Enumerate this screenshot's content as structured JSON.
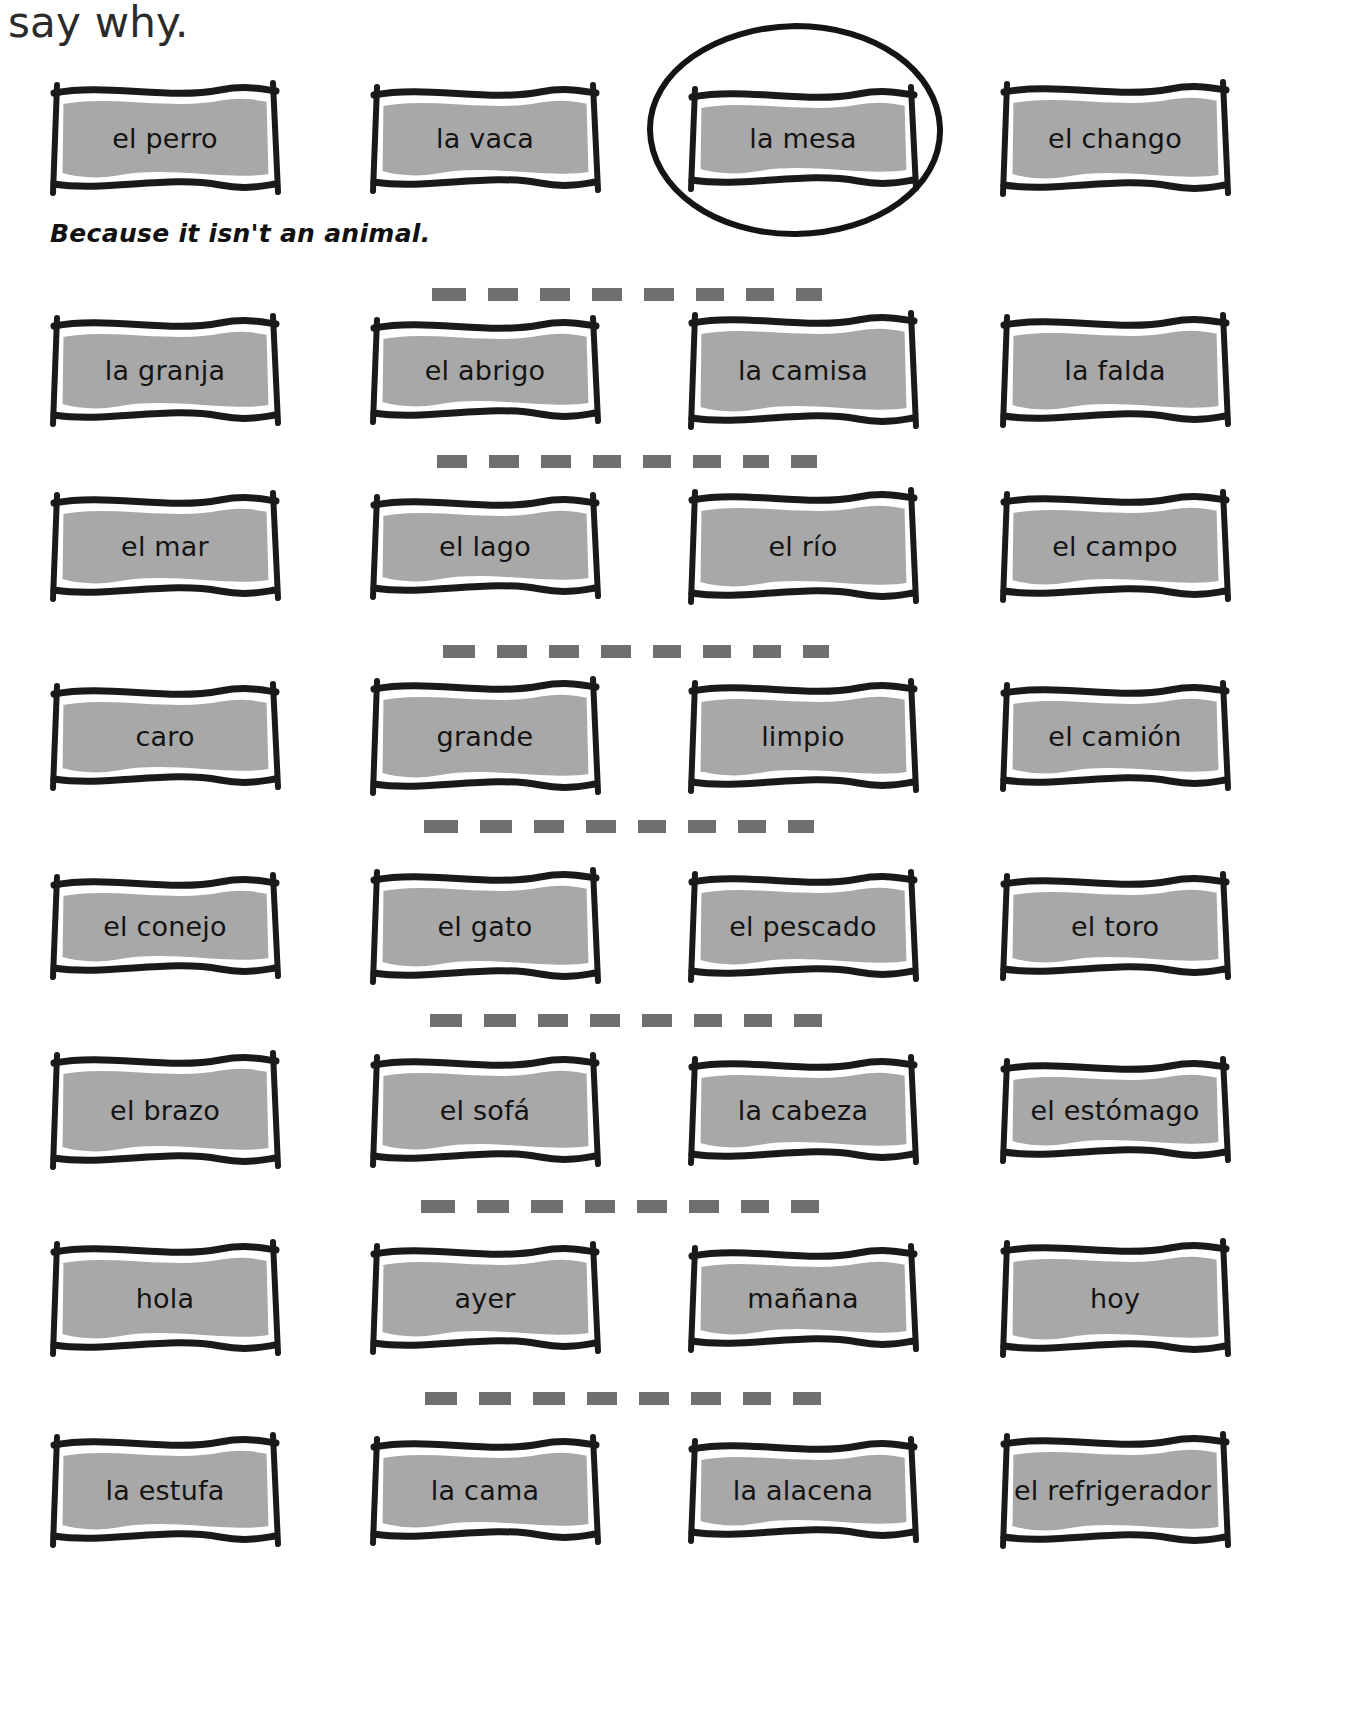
{
  "worksheet": {
    "heading": "say why.",
    "answer_text": "Because it isn't an animal.",
    "circled_item": "la mesa",
    "box_fill_color": "#a8a8a8",
    "box_outline_color": "#1a1a1a",
    "dash_color": "#6f6f6f",
    "separator_dash_count": 8,
    "rows": [
      {
        "index": 1,
        "cards": [
          {
            "label": "el perro",
            "circled": false
          },
          {
            "label": "la vaca",
            "circled": false
          },
          {
            "label": "la mesa",
            "circled": true
          },
          {
            "label": "el chango",
            "circled": false
          }
        ]
      },
      {
        "index": 2,
        "cards": [
          {
            "label": "la granja",
            "circled": false
          },
          {
            "label": "el abrigo",
            "circled": false
          },
          {
            "label": "la camisa",
            "circled": false
          },
          {
            "label": "la falda",
            "circled": false
          }
        ]
      },
      {
        "index": 3,
        "cards": [
          {
            "label": "el mar",
            "circled": false
          },
          {
            "label": "el lago",
            "circled": false
          },
          {
            "label": "el río",
            "circled": false
          },
          {
            "label": "el campo",
            "circled": false
          }
        ]
      },
      {
        "index": 4,
        "cards": [
          {
            "label": "caro",
            "circled": false
          },
          {
            "label": "grande",
            "circled": false
          },
          {
            "label": "limpio",
            "circled": false
          },
          {
            "label": "el camión",
            "circled": false
          }
        ]
      },
      {
        "index": 5,
        "cards": [
          {
            "label": "el conejo",
            "circled": false
          },
          {
            "label": "el gato",
            "circled": false
          },
          {
            "label": "el pescado",
            "circled": false
          },
          {
            "label": "el toro",
            "circled": false
          }
        ]
      },
      {
        "index": 6,
        "cards": [
          {
            "label": "el brazo",
            "circled": false
          },
          {
            "label": "el sofá",
            "circled": false
          },
          {
            "label": "la cabeza",
            "circled": false
          },
          {
            "label": "el estómago",
            "circled": false
          }
        ]
      },
      {
        "index": 7,
        "cards": [
          {
            "label": "hola",
            "circled": false
          },
          {
            "label": "ayer",
            "circled": false
          },
          {
            "label": "mañana",
            "circled": false
          },
          {
            "label": "hoy",
            "circled": false
          }
        ]
      },
      {
        "index": 8,
        "cards": [
          {
            "label": "la estufa",
            "circled": false
          },
          {
            "label": "la cama",
            "circled": false
          },
          {
            "label": "la alacena",
            "circled": false
          },
          {
            "label": "el refrigerador",
            "circled": false
          }
        ]
      }
    ]
  }
}
